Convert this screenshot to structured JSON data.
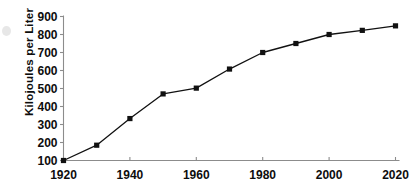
{
  "chart_data": {
    "type": "line",
    "title": "",
    "subtitle": "",
    "xlabel": "",
    "ylabel": "Kilojoules per Liter",
    "x": [
      1920,
      1930,
      1940,
      1950,
      1960,
      1970,
      1980,
      1990,
      2000,
      2010,
      2020
    ],
    "values": [
      100,
      185,
      333,
      470,
      502,
      608,
      700,
      750,
      800,
      823,
      848
    ],
    "series": [
      {
        "name": "Kilojoules per Liter",
        "values": [
          100,
          185,
          333,
          470,
          502,
          608,
          700,
          750,
          800,
          823,
          848
        ]
      }
    ],
    "xlim": [
      1920,
      2020
    ],
    "ylim": [
      100,
      900
    ],
    "x_tick_labels": [
      "1920",
      "1940",
      "1960",
      "1980",
      "2000",
      "2020"
    ],
    "x_tick_values": [
      1920,
      1940,
      1960,
      1980,
      2000,
      2020
    ],
    "x_minor_tick_values": [
      1930,
      1950,
      1970,
      1990,
      2010
    ],
    "y_tick_labels": [
      "100",
      "200",
      "300",
      "400",
      "500",
      "600",
      "700",
      "800",
      "900"
    ],
    "y_tick_values": [
      100,
      200,
      300,
      400,
      500,
      600,
      700,
      800,
      900
    ],
    "grid": false,
    "legend": false,
    "legend_position": "none",
    "marker": "square",
    "line_color": "#111111",
    "marker_color": "#111111",
    "axis_color": "#8c8c8c",
    "text_color": "#0d0d0d",
    "background_color": "#ffffff",
    "annotations": []
  },
  "axes": {
    "y_title": "Kilojoules per Liter"
  }
}
